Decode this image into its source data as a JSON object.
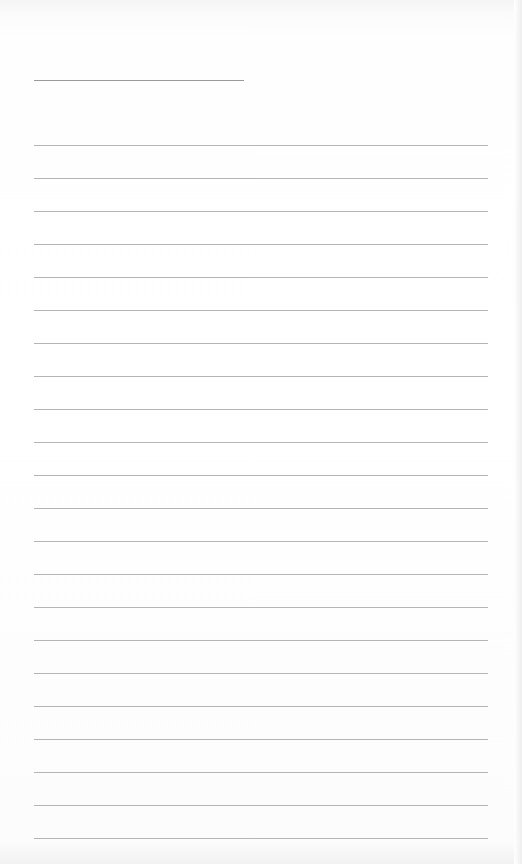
{
  "scene": {
    "description": "Blank sheet of ruled notebook paper",
    "title_line": {
      "top": 80,
      "left": 34,
      "width": 210
    },
    "rules": {
      "count": 22,
      "first_top": 145,
      "spacing": 33,
      "left": 34,
      "width": 454
    },
    "colors": {
      "paper": "#ffffff",
      "rule": "#a8a8a8"
    }
  }
}
